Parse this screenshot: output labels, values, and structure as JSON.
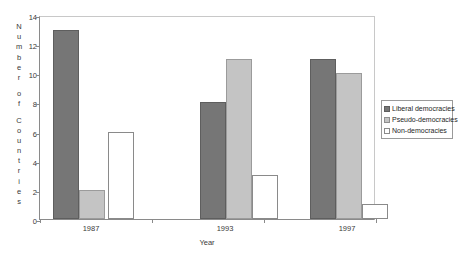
{
  "chart_data": {
    "type": "bar",
    "title": "",
    "subtitle": "",
    "xlabel": "Year",
    "ylabel": "Number of Countries",
    "categories": [
      "1987",
      "1993",
      "1997"
    ],
    "series": [
      {
        "name": "Liberal democracies",
        "values": [
          13,
          8,
          11
        ],
        "color": "#767676"
      },
      {
        "name": "Pseudo-democracies",
        "values": [
          2,
          11,
          10
        ],
        "color": "#c4c4c4"
      },
      {
        "name": "Non-democracies",
        "values": [
          6,
          3,
          1
        ],
        "color": "#ffffff"
      }
    ],
    "ylim": [
      0,
      14
    ],
    "yticks": [
      0,
      2,
      4,
      6,
      8,
      10,
      12,
      14
    ],
    "ytick_labels": [
      "0",
      "2",
      "4",
      "6",
      "8",
      "10",
      "12",
      "14"
    ],
    "grid": false,
    "legend_position": "right"
  },
  "ylabel_letters": [
    "N",
    "u",
    "m",
    "b",
    "e",
    "r",
    "",
    "o",
    "f",
    "",
    "C",
    "o",
    "u",
    "n",
    "t",
    "r",
    "i",
    "e",
    "s"
  ],
  "legend": {
    "items": [
      {
        "label": "Liberal democracies",
        "swatch": "dark-gray-swatch"
      },
      {
        "label": "Pseudo-democracies",
        "swatch": "light-gray-swatch"
      },
      {
        "label": "Non-democracies",
        "swatch": "white-swatch"
      }
    ]
  }
}
